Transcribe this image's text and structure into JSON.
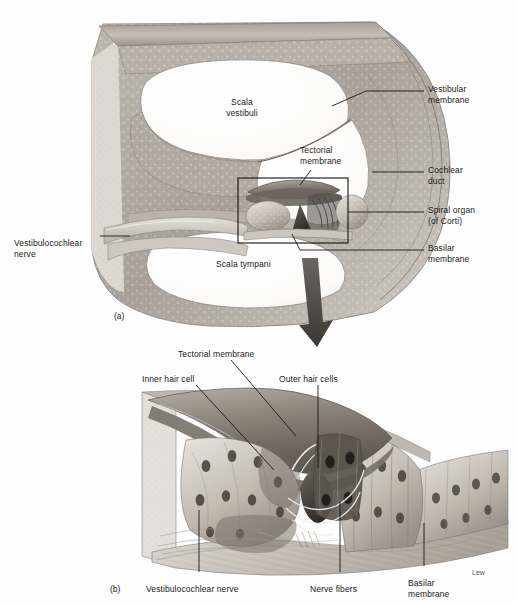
{
  "figure": {
    "background_color": "#fdfdfd",
    "ink_color": "#1a1a1a",
    "signature": "Lew"
  },
  "panel_a": {
    "tag": "(a)",
    "labels": {
      "scala_vestibuli": "Scala\nvestibuli",
      "scala_tympani": "Scala tympani",
      "tectorial_membrane": "Tectorial\nmembrane",
      "vestibular_membrane": "Vestibular\nmembrane",
      "cochlear_duct": "Cochlear\nduct",
      "spiral_organ": "Spiral organ\n(of Corti)",
      "basilar_membrane": "Basilar\nmembrane",
      "vestibulocochlear_nerve": "Vestibulocochlear\nnerve"
    }
  },
  "panel_b": {
    "tag": "(b)",
    "labels": {
      "tectorial_membrane": "Tectorial membrane",
      "inner_hair_cell": "Inner hair cell",
      "outer_hair_cells": "Outer hair cells",
      "vestibulocochlear_nerve": "Vestibulocochlear nerve",
      "nerve_fibers": "Nerve fibers",
      "basilar_membrane": "Basilar\nmembrane"
    }
  }
}
